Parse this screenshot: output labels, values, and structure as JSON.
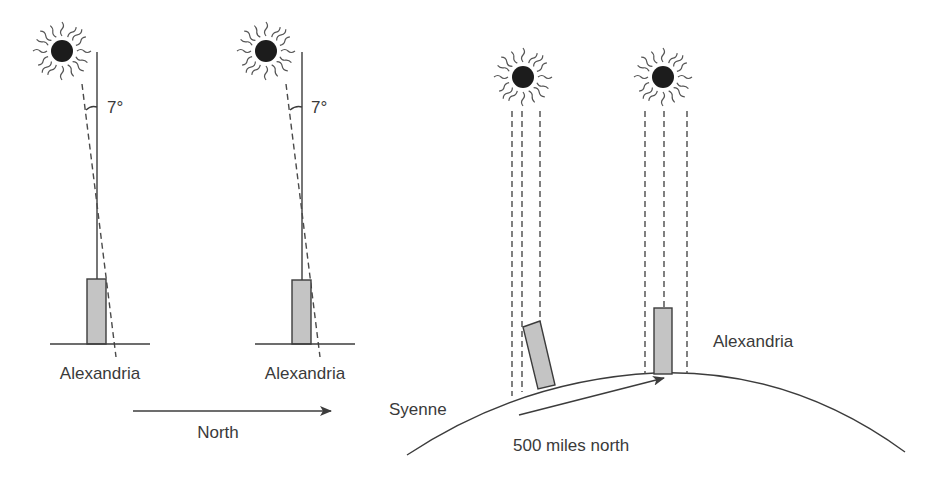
{
  "diagram": {
    "colors": {
      "ink": "#3c3c3c",
      "obelisk_fill": "#c4c4c4",
      "sun": "#1c1c1c",
      "background": "#ffffff"
    },
    "left_panels": [
      {
        "id": "panel-1",
        "angle_label": "7°",
        "city_label": "Alexandria"
      },
      {
        "id": "panel-2",
        "angle_label": "7°",
        "city_label": "Alexandria"
      }
    ],
    "direction_arrow": {
      "label": "North"
    },
    "right_panel": {
      "left_city_label": "Syenne",
      "right_city_label": "Alexandria",
      "distance_label": "500 miles north"
    }
  }
}
